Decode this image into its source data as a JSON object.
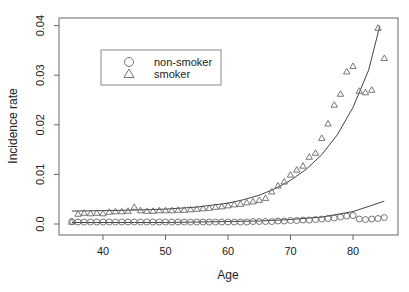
{
  "chart_data": {
    "type": "scatter",
    "title": "",
    "xlabel": "Age",
    "ylabel": "Incidence rate",
    "xlim": [
      34,
      86.5
    ],
    "ylim": [
      0,
      0.04
    ],
    "xticks": [
      40,
      50,
      60,
      70,
      80
    ],
    "yticks": [
      0.0,
      0.01,
      0.02,
      0.03,
      0.04
    ],
    "ytick_labels": [
      "0.0",
      "0.01",
      "0.02",
      "0.03",
      "0.04"
    ],
    "grid": false,
    "legend": {
      "position": "upper-left",
      "entries": [
        {
          "label": "non-smoker",
          "marker": "circle"
        },
        {
          "label": "smoker",
          "marker": "triangle"
        }
      ]
    },
    "series": [
      {
        "name": "non-smoker",
        "marker": "circle",
        "x": [
          35,
          36,
          37,
          38,
          39,
          40,
          41,
          42,
          43,
          44,
          45,
          46,
          47,
          48,
          49,
          50,
          51,
          52,
          53,
          54,
          55,
          56,
          57,
          58,
          59,
          60,
          61,
          62,
          63,
          64,
          65,
          66,
          67,
          68,
          69,
          70,
          71,
          72,
          73,
          74,
          75,
          76,
          77,
          78,
          79,
          80,
          81,
          82,
          83,
          84,
          85
        ],
        "y": [
          0.0005,
          0.0004,
          0.0004,
          0.0004,
          0.0004,
          0.0004,
          0.0004,
          0.0004,
          0.0004,
          0.0004,
          0.0004,
          0.0004,
          0.0004,
          0.0004,
          0.0004,
          0.0004,
          0.0004,
          0.0004,
          0.0004,
          0.0004,
          0.0004,
          0.0004,
          0.0004,
          0.0004,
          0.0004,
          0.0004,
          0.0004,
          0.0004,
          0.0004,
          0.0005,
          0.0005,
          0.0005,
          0.0005,
          0.0006,
          0.0006,
          0.0007,
          0.0007,
          0.0008,
          0.0008,
          0.0009,
          0.001,
          0.0011,
          0.0012,
          0.0014,
          0.0016,
          0.0017,
          0.001,
          0.0009,
          0.001,
          0.0011,
          0.0013
        ]
      },
      {
        "name": "smoker",
        "marker": "triangle",
        "x": [
          35,
          36,
          37,
          38,
          39,
          40,
          41,
          42,
          43,
          44,
          45,
          46,
          47,
          48,
          49,
          50,
          51,
          52,
          53,
          54,
          55,
          56,
          57,
          58,
          59,
          60,
          61,
          62,
          63,
          64,
          65,
          66,
          67,
          68,
          69,
          70,
          71,
          72,
          73,
          74,
          75,
          76,
          77,
          78,
          79,
          80,
          81,
          82,
          83,
          84,
          85
        ],
        "y": [
          0.0004,
          0.002,
          0.0022,
          0.0021,
          0.0022,
          0.0021,
          0.0024,
          0.0025,
          0.0025,
          0.0026,
          0.0034,
          0.0027,
          0.0026,
          0.0026,
          0.0027,
          0.0027,
          0.0027,
          0.0028,
          0.0028,
          0.0029,
          0.003,
          0.0031,
          0.0032,
          0.0034,
          0.0035,
          0.0037,
          0.0039,
          0.004,
          0.0043,
          0.0045,
          0.0048,
          0.0052,
          0.0065,
          0.0077,
          0.0085,
          0.0099,
          0.0109,
          0.0117,
          0.0135,
          0.0143,
          0.0173,
          0.0202,
          0.024,
          0.0262,
          0.0307,
          0.0318,
          0.0268,
          0.0265,
          0.027,
          0.0395,
          0.0334
        ]
      }
    ],
    "fitted_curves": [
      {
        "name": "non-smoker fit",
        "x": [
          35,
          40,
          45,
          50,
          55,
          60,
          65,
          70,
          75,
          80,
          85
        ],
        "y": [
          0.0003,
          0.0003,
          0.0003,
          0.0003,
          0.0004,
          0.0005,
          0.0006,
          0.0009,
          0.0014,
          0.0025,
          0.0046
        ]
      },
      {
        "name": "smoker fit",
        "x": [
          35,
          40,
          45,
          50,
          55,
          60,
          62.5,
          65,
          67.5,
          70,
          72.5,
          75,
          77.5,
          80,
          82.5,
          84.3
        ],
        "y": [
          0.0026,
          0.0027,
          0.0028,
          0.003,
          0.0034,
          0.0042,
          0.0049,
          0.0058,
          0.0071,
          0.0088,
          0.011,
          0.014,
          0.018,
          0.0235,
          0.031,
          0.04
        ]
      }
    ]
  }
}
